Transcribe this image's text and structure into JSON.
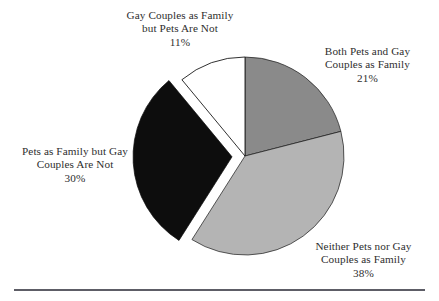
{
  "figure": {
    "name": "pie-chart-pets-and-gay-couples-as-family",
    "background": "#ffffff",
    "rule": {
      "color": "#5d5d66"
    }
  },
  "chart_data": {
    "type": "pie",
    "title": "",
    "subtitle": "",
    "xlabel": "",
    "ylabel": "",
    "legend_position": "none",
    "grid": false,
    "units": "percent",
    "total": 100,
    "start_angle_deg": 0,
    "direction": "clockwise",
    "center": {
      "x": 245,
      "y": 156
    },
    "radius": 99,
    "categories": [
      "Both Pets and Gay Couples as Family",
      "Neither Pets nor Gay Couples as Family",
      "Pets as Family but Gay Couples Are Not",
      "Gay Couples as Family but Pets Are Not"
    ],
    "values": [
      21,
      38,
      30,
      11
    ],
    "colors": [
      "#8a8a8a",
      "#b4b4b4",
      "#0d0d0d",
      "#ffffff"
    ],
    "exploded": [
      false,
      false,
      true,
      false
    ],
    "slice_outline": "#1a1a1a",
    "slices": [
      {
        "key": "both",
        "label_lines": [
          "Both Pets and Gay",
          "Couples as Family"
        ],
        "percent_text": "21%",
        "value": 21,
        "color": "#8a8a8a",
        "exploded": false
      },
      {
        "key": "neither",
        "label_lines": [
          "Neither Pets nor Gay",
          "Couples as Family"
        ],
        "percent_text": "38%",
        "value": 38,
        "color": "#b4b4b4",
        "exploded": false
      },
      {
        "key": "pets_not_gay",
        "label_lines": [
          "Pets as Family but Gay",
          "Couples Are Not"
        ],
        "percent_text": "30%",
        "value": 30,
        "color": "#0d0d0d",
        "exploded": true
      },
      {
        "key": "gay_not_pets",
        "label_lines": [
          "Gay Couples as Family",
          "but Pets Are Not"
        ],
        "percent_text": "11%",
        "value": 11,
        "color": "#ffffff",
        "exploded": false
      }
    ]
  },
  "labels": {
    "gay_not_pets": {
      "line1": "Gay Couples as Family",
      "line2": "but Pets Are Not",
      "percent": "11%"
    },
    "both": {
      "line1": "Both Pets and Gay",
      "line2": "Couples as Family",
      "percent": "21%"
    },
    "neither": {
      "line1": "Neither Pets nor Gay",
      "line2": "Couples as Family",
      "percent": "38%"
    },
    "pets_not_gay": {
      "line1": "Pets as Family but Gay",
      "line2": "Couples Are Not",
      "percent": "30%"
    }
  }
}
